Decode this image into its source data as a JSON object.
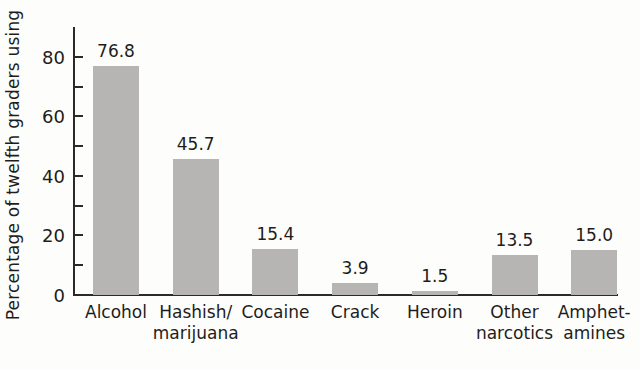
{
  "chart": {
    "colors": {
      "bar": "#b6b5b3",
      "axis": "#2b2a27",
      "text": "#1e1d1b",
      "background": "#fdfdfb"
    }
  },
  "chart_data": {
    "type": "bar",
    "title": "",
    "xlabel": "",
    "ylabel": "Percentage of twelfth graders using",
    "categories": [
      "Alcohol",
      "Hashish/\nmarijuana",
      "Cocaine",
      "Crack",
      "Heroin",
      "Other\nnarcotics",
      "Amphet-\namines"
    ],
    "values": [
      76.8,
      45.7,
      15.4,
      3.9,
      1.5,
      13.5,
      15.0
    ],
    "data_labels": [
      "76.8",
      "45.7",
      "15.4",
      "3.9",
      "1.5",
      "13.5",
      "15.0"
    ],
    "ylim": [
      0,
      90
    ],
    "yticks_labeled": [
      0,
      20,
      40,
      60,
      80
    ],
    "yticks_minor": [
      10,
      30,
      50,
      70
    ],
    "grid": false,
    "legend": null
  }
}
